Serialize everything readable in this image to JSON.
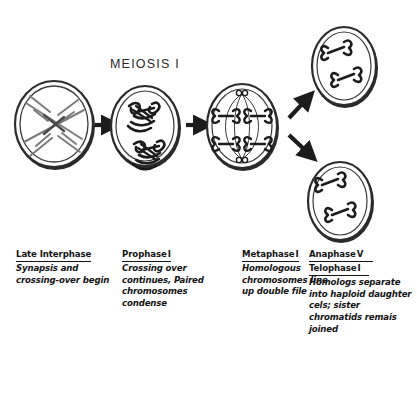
{
  "diagram": {
    "title": "MEIOSIS I",
    "background_color": "#ffffff",
    "ink_color": "#1a1a1a",
    "cells": [
      {
        "id": "late-interphase-cell",
        "stage": "Late Interphase",
        "chromosome_style": "long thin uncondensed crossed chromosomes",
        "chromosome_count": 2,
        "shading": "grey"
      },
      {
        "id": "prophase-i-cell",
        "stage": "Prophase I",
        "chromosome_style": "condensed paired tetrads with chiasmata",
        "chromosome_count": 2,
        "shading": "black"
      },
      {
        "id": "metaphase-i-cell",
        "stage": "Metaphase I",
        "chromosome_style": "tetrads aligned at equator with spindle fibers",
        "chromosome_count": 4,
        "shading": "black"
      },
      {
        "id": "daughter-cell-top",
        "stage": "Anaphase I / Telophase I",
        "chromosome_style": "two condensed chromosomes, sister chromatids joined",
        "chromosome_count": 2,
        "shading": "black"
      },
      {
        "id": "daughter-cell-bottom",
        "stage": "Anaphase I / Telophase I",
        "chromosome_style": "two condensed chromosomes, sister chromatids joined",
        "chromosome_count": 2,
        "shading": "black"
      }
    ],
    "arrows": [
      {
        "id": "arrow-1",
        "from": "late-interphase-cell",
        "to": "prophase-i-cell",
        "direction": "right"
      },
      {
        "id": "arrow-2",
        "from": "prophase-i-cell",
        "to": "metaphase-i-cell",
        "direction": "right"
      },
      {
        "id": "arrow-3",
        "from": "metaphase-i-cell",
        "to": "daughter-cell-top",
        "direction": "up-right"
      },
      {
        "id": "arrow-4",
        "from": "metaphase-i-cell",
        "to": "daughter-cell-bottom",
        "direction": "down-right"
      }
    ]
  },
  "captions": [
    {
      "phase": "Late Interphase",
      "numeral": "",
      "phase2": "",
      "numeral2": "",
      "text": "Synapsis and crossing-over begin"
    },
    {
      "phase": "Prophase",
      "numeral": "I",
      "phase2": "",
      "numeral2": "",
      "text": "Crossing over continues, Paired chromosomes condense"
    },
    {
      "phase": "Metaphase",
      "numeral": "I",
      "phase2": "",
      "numeral2": "",
      "text": "Homologous chromosomes line up double file"
    },
    {
      "phase": "Anaphase",
      "numeral": "V",
      "phase2": "Telophase",
      "numeral2": "I",
      "text": "Homologs separate into haploid daughter cels; sister chromatids remais joined"
    }
  ]
}
